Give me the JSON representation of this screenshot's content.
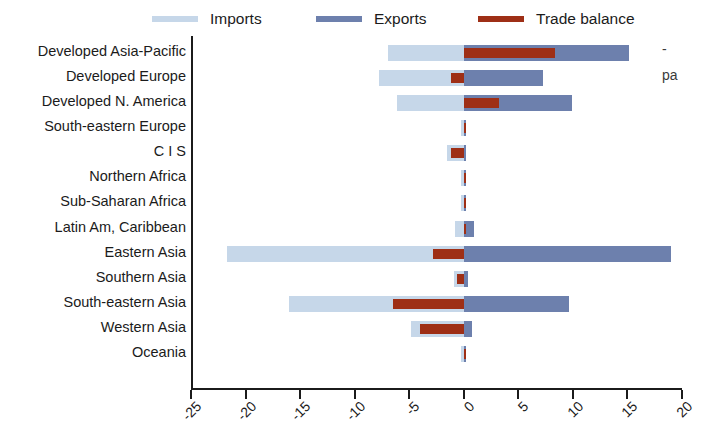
{
  "top_sliver_text": "",
  "legend": {
    "items": [
      {
        "label": "Imports",
        "color": "#c6d7e9",
        "x": 152
      },
      {
        "label": "Exports",
        "color": "#6d80ad",
        "x": 316
      },
      {
        "label": "Trade balance",
        "color": "#9e2f16",
        "x": 478
      }
    ]
  },
  "right_caption": {
    "line1": "-",
    "line2": "pa"
  },
  "colors": {
    "imports": "#c6d7e9",
    "exports": "#6d80ad",
    "balance": "#9e2f16",
    "axis": "#1b1b1b",
    "background": "#ffffff"
  },
  "chart_data": {
    "type": "bar",
    "orientation": "horizontal",
    "title": "",
    "xlabel": "",
    "ylabel": "",
    "xlim": [
      -25,
      20
    ],
    "xticks": [
      -25,
      -20,
      -15,
      -10,
      -5,
      0,
      5,
      10,
      15,
      20
    ],
    "xtick_labels": [
      "-25",
      "-20",
      "-15",
      "-10",
      "-5",
      "0",
      "5",
      "10",
      "15",
      "20"
    ],
    "grid": false,
    "legend_position": "top",
    "categories": [
      "Developed Asia-Pacific",
      "Developed Europe",
      "Developed N. America",
      "South-eastern Europe",
      "C I S",
      "Northern Africa",
      "Sub-Saharan Africa",
      "Latin Am, Caribbean",
      "Eastern Asia",
      "Southern Asia",
      "South-eastern Asia",
      "Western Asia",
      "Oceania"
    ],
    "series": [
      {
        "name": "Imports",
        "color": "#c6d7e9",
        "values": [
          -6.9,
          -7.8,
          -6.1,
          -0.1,
          -1.5,
          -0.1,
          -0.1,
          -0.8,
          -21.7,
          -0.9,
          -16.0,
          -4.8,
          -0.1
        ]
      },
      {
        "name": "Exports",
        "color": "#6d80ad",
        "values": [
          15.1,
          7.3,
          9.9,
          0.1,
          0.2,
          0.1,
          0.1,
          0.9,
          19.0,
          0.4,
          9.6,
          0.8,
          0.1
        ]
      },
      {
        "name": "Trade balance",
        "color": "#9e2f16",
        "values": [
          8.4,
          -1.2,
          3.2,
          0.05,
          -1.2,
          0.1,
          0.1,
          0.05,
          -2.8,
          -0.6,
          -6.5,
          -4.0,
          0.1
        ]
      }
    ]
  }
}
